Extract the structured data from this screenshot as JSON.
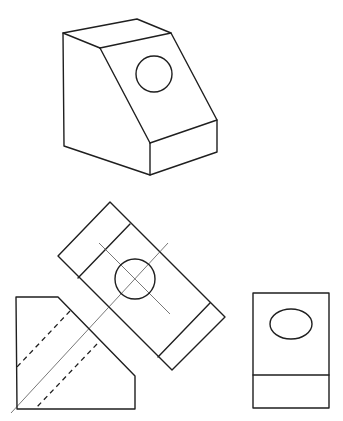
{
  "diagram": {
    "type": "orthographic-projection-with-auxiliary-view",
    "background": "#ffffff",
    "line_color": "#1f1f1f",
    "centerline_color": "#555555",
    "views": [
      {
        "name": "isometric-view",
        "description": "Block with inclined face containing a circular hole",
        "outline": [
          [
            63,
            33
          ],
          [
            137,
            19
          ],
          [
            171,
            33
          ],
          [
            217,
            120
          ],
          [
            217,
            152
          ],
          [
            150,
            175
          ],
          [
            64,
            146
          ]
        ],
        "edges": [
          [
            [
              63,
              33
            ],
            [
              100,
              48
            ]
          ],
          [
            [
              100,
              48
            ],
            [
              171,
              33
            ]
          ],
          [
            [
              100,
              48
            ],
            [
              150,
              143
            ]
          ],
          [
            [
              150,
              143
            ],
            [
              217,
              120
            ]
          ],
          [
            [
              150,
              143
            ],
            [
              150,
              175
            ]
          ]
        ],
        "hole": {
          "cx": 154,
          "cy": 74,
          "r": 18
        }
      },
      {
        "name": "auxiliary-view",
        "description": "True-size view of inclined face",
        "outline": [
          [
            110,
            202
          ],
          [
            225,
            317
          ],
          [
            172,
            370
          ],
          [
            58,
            256
          ]
        ],
        "edges": [
          [
            [
              130,
              224
            ],
            [
              78,
              278
            ]
          ],
          [
            [
              210,
              303
            ],
            [
              158,
              357
            ]
          ]
        ],
        "hole": {
          "cx": 135,
          "cy": 279,
          "r": 20
        },
        "centerlines": [
          [
            [
              99,
              243
            ],
            [
              170,
              314
            ]
          ],
          [
            [
              168,
              243
            ],
            [
              11,
              413
            ]
          ]
        ]
      },
      {
        "name": "front-view",
        "outline": [
          [
            16,
            297
          ],
          [
            58,
            297
          ],
          [
            135,
            376
          ],
          [
            135,
            409
          ],
          [
            17,
            409
          ]
        ],
        "hidden_lines": [
          [
            [
              70,
              311
            ],
            [
              17,
              367
            ]
          ],
          [
            [
              97,
              344
            ],
            [
              35,
              409
            ]
          ]
        ]
      },
      {
        "name": "side-view",
        "outline_rect": {
          "x": 253,
          "y": 293,
          "w": 76,
          "h": 115
        },
        "edges": [
          [
            [
              253,
              375
            ],
            [
              329,
              375
            ]
          ]
        ],
        "hole": {
          "cx": 291,
          "cy": 324,
          "rx": 21,
          "ry": 15
        }
      }
    ]
  }
}
